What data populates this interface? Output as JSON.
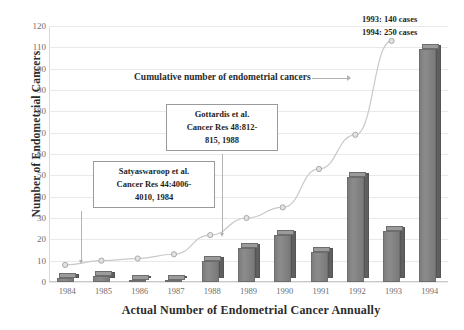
{
  "chart_data": {
    "type": "bar",
    "title": "",
    "xlabel": "Actual Number of Endometrial Cancer Annually",
    "ylabel": "Number of Endometrial Cancers",
    "categories": [
      "1984",
      "1985",
      "1986",
      "1987",
      "1988",
      "1989",
      "1990",
      "1991",
      "1992",
      "1993",
      "1994"
    ],
    "ylim": [
      0,
      120
    ],
    "ytick_step": 10,
    "yticks": [
      "120",
      "110",
      "100",
      "90",
      "80",
      "70",
      "60",
      "50",
      "40",
      "30",
      "20",
      "10",
      "0"
    ],
    "grid": true,
    "legend_position": "none",
    "series": [
      {
        "name": "Actual number of endometrial cancers",
        "type": "bar",
        "values": [
          2,
          3,
          1,
          1,
          10,
          16,
          22,
          14,
          49,
          24,
          109
        ]
      },
      {
        "name": "Cumulative number of endometrial cancers",
        "type": "line",
        "values": [
          8,
          10,
          11,
          13,
          22,
          30,
          35,
          53,
          69,
          113,
          null
        ]
      }
    ],
    "annotations": [
      {
        "name": "satyaswaroop-callout",
        "lines": [
          "Satyaswaroop et al.",
          "Cancer Res 44:4006-",
          "4010, 1984"
        ],
        "points_to": "1984"
      },
      {
        "name": "gottardis-callout",
        "lines": [
          "Gottardis et al.",
          "Cancer Res 48:812-",
          "815, 1988"
        ],
        "points_to": "1988"
      },
      {
        "name": "series-label-cumulative",
        "text": "Cumulative number of endometrial cancers"
      },
      {
        "name": "note-1993",
        "text": "1993: 140 cases"
      },
      {
        "name": "note-1994",
        "text": "1994: 250 cases"
      }
    ],
    "colors": {
      "bar_face": "#8c8c8c",
      "bar_side": "#5f5f5f",
      "bar_top": "#9b9b9b",
      "line": "#c4c4c4",
      "grid": "#e9e9e9",
      "text": "#2b2b2b",
      "tick_text": "#6e6e6e"
    }
  }
}
